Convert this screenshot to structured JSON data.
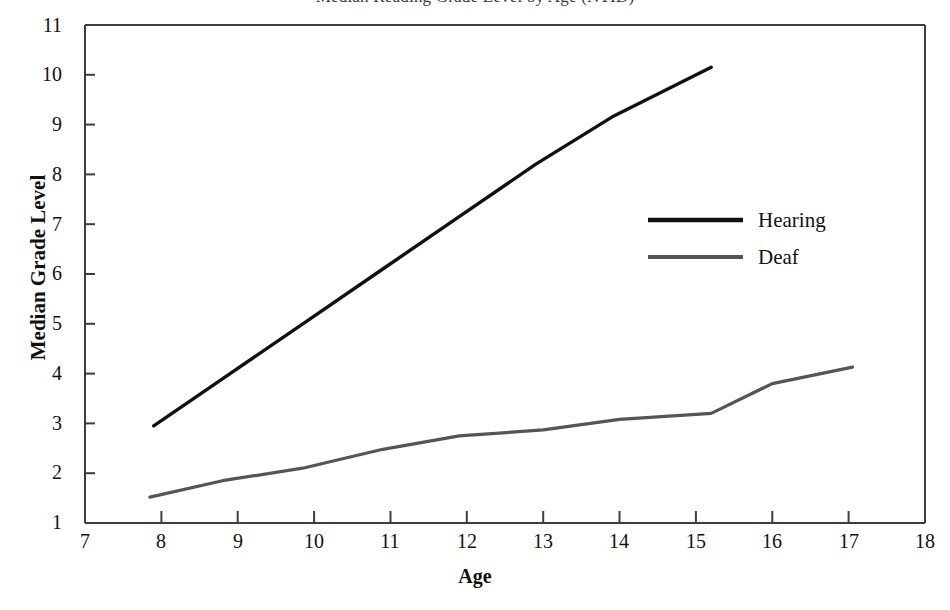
{
  "chart_data": {
    "type": "line",
    "title": "Median Reading Grade Level by Age (NTID)",
    "xlabel": "Age",
    "ylabel": "Median Grade Level",
    "xlim": [
      7,
      18
    ],
    "ylim": [
      1,
      11
    ],
    "xticks": [
      7,
      8,
      9,
      10,
      11,
      12,
      13,
      14,
      15,
      16,
      17,
      18
    ],
    "yticks": [
      1,
      2,
      3,
      4,
      5,
      6,
      7,
      8,
      9,
      10,
      11
    ],
    "grid": false,
    "legend_position": "center-right",
    "series": [
      {
        "name": "Hearing",
        "color": "#111111",
        "width": 3,
        "x": [
          7.9,
          8.9,
          9.9,
          10.9,
          11.9,
          12.9,
          13.9,
          15.2
        ],
        "y": [
          2.95,
          4.0,
          5.05,
          6.1,
          7.15,
          8.2,
          9.15,
          10.15
        ]
      },
      {
        "name": "Deaf",
        "color": "#555555",
        "width": 3,
        "x": [
          7.85,
          8.8,
          9.85,
          10.9,
          11.9,
          13.0,
          14.0,
          15.2,
          16.0,
          17.05
        ],
        "y": [
          1.52,
          1.85,
          2.1,
          2.48,
          2.75,
          2.87,
          3.08,
          3.2,
          3.8,
          4.13
        ]
      }
    ]
  },
  "axes": {
    "x_title": "Age",
    "y_title": "Median Grade Level",
    "x_tick_labels": [
      "7",
      "8",
      "9",
      "10",
      "11",
      "12",
      "13",
      "14",
      "15",
      "16",
      "17",
      "18"
    ],
    "y_tick_labels": [
      "11",
      "10",
      "9",
      "8",
      "7",
      "6",
      "5",
      "4",
      "3",
      "2",
      "1"
    ]
  },
  "legend": {
    "entries": [
      {
        "label": "Hearing",
        "color": "#111111"
      },
      {
        "label": "Deaf",
        "color": "#555555"
      }
    ]
  },
  "title_text": "Median Reading Grade Level by Age (NTID)"
}
